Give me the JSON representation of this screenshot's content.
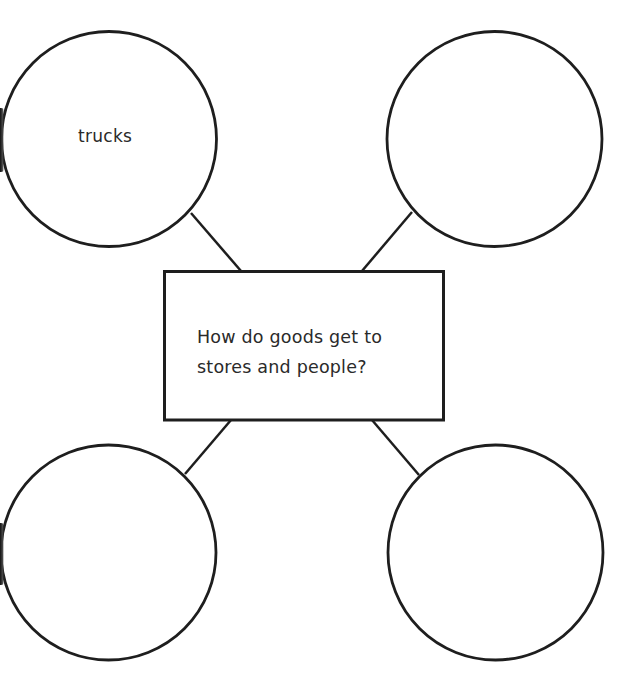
{
  "diagram": {
    "type": "bubble-map",
    "stroke_color": "#1e1e1e",
    "background_color": "#ffffff",
    "center": {
      "label_lines": [
        "How do goods get to",
        "stores and people?"
      ]
    },
    "bubbles": [
      {
        "position": "top-left",
        "label": "trucks"
      },
      {
        "position": "top-right",
        "label": ""
      },
      {
        "position": "bottom-left",
        "label": ""
      },
      {
        "position": "bottom-right",
        "label": ""
      }
    ]
  }
}
